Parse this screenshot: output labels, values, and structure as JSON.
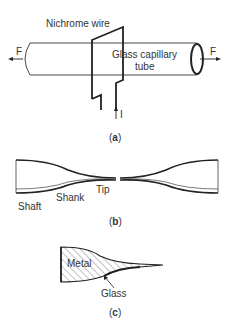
{
  "panels": {
    "a": {
      "caption_open": "(",
      "caption_letter": "a",
      "caption_close": ")",
      "labels": {
        "wire": "Nichrome wire",
        "tube_line1": "Glass capillary",
        "tube_line2": "tube",
        "force_left": "F",
        "force_right": "F",
        "current": "I"
      }
    },
    "b": {
      "caption_open": "(",
      "caption_letter": "b",
      "caption_close": ")",
      "labels": {
        "shaft": "Shaft",
        "shank": "Shank",
        "tip": "Tip"
      }
    },
    "c": {
      "caption_open": "(",
      "caption_letter": "c",
      "caption_close": ")",
      "labels": {
        "metal": "Metal",
        "glass": "Glass"
      }
    }
  },
  "colors": {
    "stroke": "#222222",
    "text": "#333333",
    "background": "#ffffff"
  }
}
